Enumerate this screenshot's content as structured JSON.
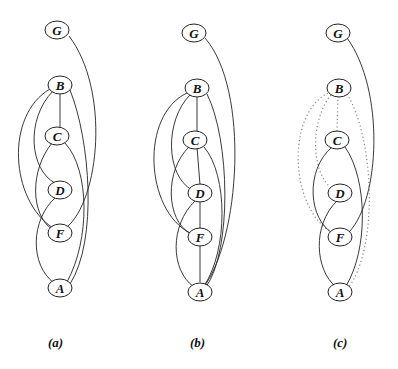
{
  "figure": {
    "panels": [
      {
        "id": "a",
        "caption": "(a)"
      },
      {
        "id": "b",
        "caption": "(b)"
      },
      {
        "id": "c",
        "caption": "(c)"
      }
    ],
    "nodes": [
      "G",
      "B",
      "C",
      "D",
      "F",
      "A"
    ],
    "panel_a_edges": [
      [
        "G",
        "F"
      ],
      [
        "B",
        "C"
      ],
      [
        "B",
        "D"
      ],
      [
        "B",
        "F"
      ],
      [
        "B",
        "A"
      ],
      [
        "C",
        "F"
      ],
      [
        "C",
        "A"
      ],
      [
        "D",
        "A"
      ]
    ],
    "panel_b_edges": [
      [
        "G",
        "A"
      ],
      [
        "B",
        "C"
      ],
      [
        "B",
        "D"
      ],
      [
        "B",
        "F"
      ],
      [
        "B",
        "A"
      ],
      [
        "C",
        "D"
      ],
      [
        "C",
        "F"
      ],
      [
        "C",
        "A"
      ],
      [
        "D",
        "F"
      ],
      [
        "D",
        "A"
      ],
      [
        "F",
        "A"
      ]
    ],
    "panel_c_solid_edges": [
      [
        "G",
        "F"
      ],
      [
        "C",
        "F"
      ],
      [
        "C",
        "A"
      ],
      [
        "D",
        "A"
      ]
    ],
    "panel_c_dotted_edges": [
      [
        "B",
        "C"
      ],
      [
        "B",
        "D"
      ],
      [
        "B",
        "F"
      ],
      [
        "B",
        "A"
      ]
    ]
  },
  "labels": {
    "G": "G",
    "B": "B",
    "C": "C",
    "D": "D",
    "F": "F",
    "A": "A"
  }
}
